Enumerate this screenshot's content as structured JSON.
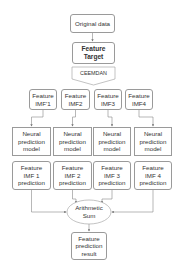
{
  "nodes": {
    "original": "Original data",
    "target": "Feature\nTarget",
    "decomp": "CEEMDAN",
    "imfs": [
      "Feature\nIMF'1",
      "Feature\nIMF2",
      "Feature\nIMF3",
      "Feature\nIMF4"
    ],
    "models": [
      "Neural\nprediction\nmodel",
      "Neural\nprediction\nmodel",
      "Neural\nprediction\nmodel",
      "Neural\nprediction\nmodel"
    ],
    "predictions": [
      "Feature\nIMF 1\nprediction",
      "Feature\nIMF 2\nprediction",
      "Feature\nIMF 3\nprediction",
      "Feature\nIMF 4\nprediction"
    ],
    "sum": "Arithmetic\nSum",
    "result": "Feature\nprediction\nresult"
  },
  "colors": {
    "stroke": "#9a9a9a",
    "text": "#333333"
  }
}
